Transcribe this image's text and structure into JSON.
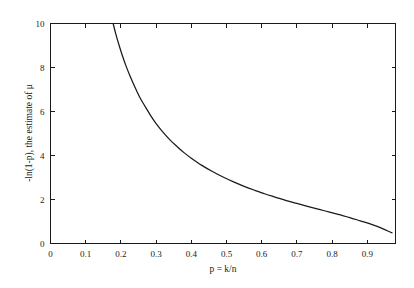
{
  "chart_data": {
    "type": "line",
    "title": "",
    "xlabel": "p = k/n",
    "ylabel": "-ln(1-p), the estimate of μ",
    "xlim": [
      0,
      0.98
    ],
    "ylim": [
      0,
      10
    ],
    "grid": false,
    "legend": null,
    "xticks": [
      0,
      0.1,
      0.2,
      0.3,
      0.4,
      0.5,
      0.6,
      0.7,
      0.8,
      0.9
    ],
    "xticklabels": [
      "0",
      "0.1",
      "0.2",
      "0.3",
      "0.4",
      "0.5",
      "0.6",
      "0.7",
      "0.8",
      "0.9"
    ],
    "yticks": [
      0,
      2,
      4,
      6,
      8,
      10
    ],
    "yticklabels": [
      "0",
      "2",
      "4",
      "6",
      "8",
      "10"
    ],
    "series": [
      {
        "name": "-ln(1-p), the estimate of μ",
        "color": "#1a1a1a",
        "x": [
          0.178,
          0.185,
          0.195,
          0.205,
          0.215,
          0.225,
          0.24,
          0.255,
          0.27,
          0.285,
          0.3,
          0.32,
          0.34,
          0.36,
          0.38,
          0.4,
          0.43,
          0.46,
          0.49,
          0.52,
          0.55,
          0.58,
          0.61,
          0.64,
          0.67,
          0.7,
          0.73,
          0.76,
          0.79,
          0.82,
          0.85,
          0.88,
          0.91,
          0.94,
          0.97
        ],
        "y": [
          10.0,
          9.55,
          9.0,
          8.5,
          8.05,
          7.65,
          7.1,
          6.6,
          6.2,
          5.8,
          5.45,
          5.05,
          4.7,
          4.4,
          4.12,
          3.88,
          3.55,
          3.27,
          3.02,
          2.8,
          2.6,
          2.42,
          2.25,
          2.1,
          1.95,
          1.82,
          1.69,
          1.56,
          1.44,
          1.31,
          1.18,
          1.03,
          0.88,
          0.7,
          0.48
        ]
      }
    ]
  }
}
